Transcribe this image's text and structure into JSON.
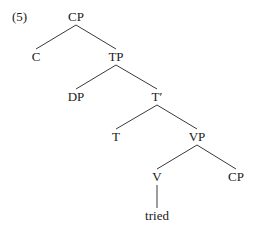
{
  "example_number": "(5)",
  "tree": {
    "nodes": [
      {
        "id": "cp_root",
        "label": "CP",
        "x": 76,
        "y": 10
      },
      {
        "id": "c",
        "label": "C",
        "x": 36,
        "y": 50
      },
      {
        "id": "tp",
        "label": "TP",
        "x": 116,
        "y": 50
      },
      {
        "id": "dp",
        "label": "DP",
        "x": 76,
        "y": 90
      },
      {
        "id": "t_bar",
        "label": "T′",
        "x": 157,
        "y": 90
      },
      {
        "id": "t",
        "label": "T",
        "x": 116,
        "y": 130
      },
      {
        "id": "vp",
        "label": "VP",
        "x": 197,
        "y": 130
      },
      {
        "id": "v",
        "label": "V",
        "x": 157,
        "y": 170
      },
      {
        "id": "cp_comp",
        "label": "CP",
        "x": 236,
        "y": 170
      },
      {
        "id": "tried",
        "label": "tried",
        "x": 157,
        "y": 209
      }
    ],
    "edges": [
      [
        "cp_root",
        "c"
      ],
      [
        "cp_root",
        "tp"
      ],
      [
        "tp",
        "dp"
      ],
      [
        "tp",
        "t_bar"
      ],
      [
        "t_bar",
        "t"
      ],
      [
        "t_bar",
        "vp"
      ],
      [
        "vp",
        "v"
      ],
      [
        "vp",
        "cp_comp"
      ],
      [
        "v",
        "tried"
      ]
    ]
  }
}
